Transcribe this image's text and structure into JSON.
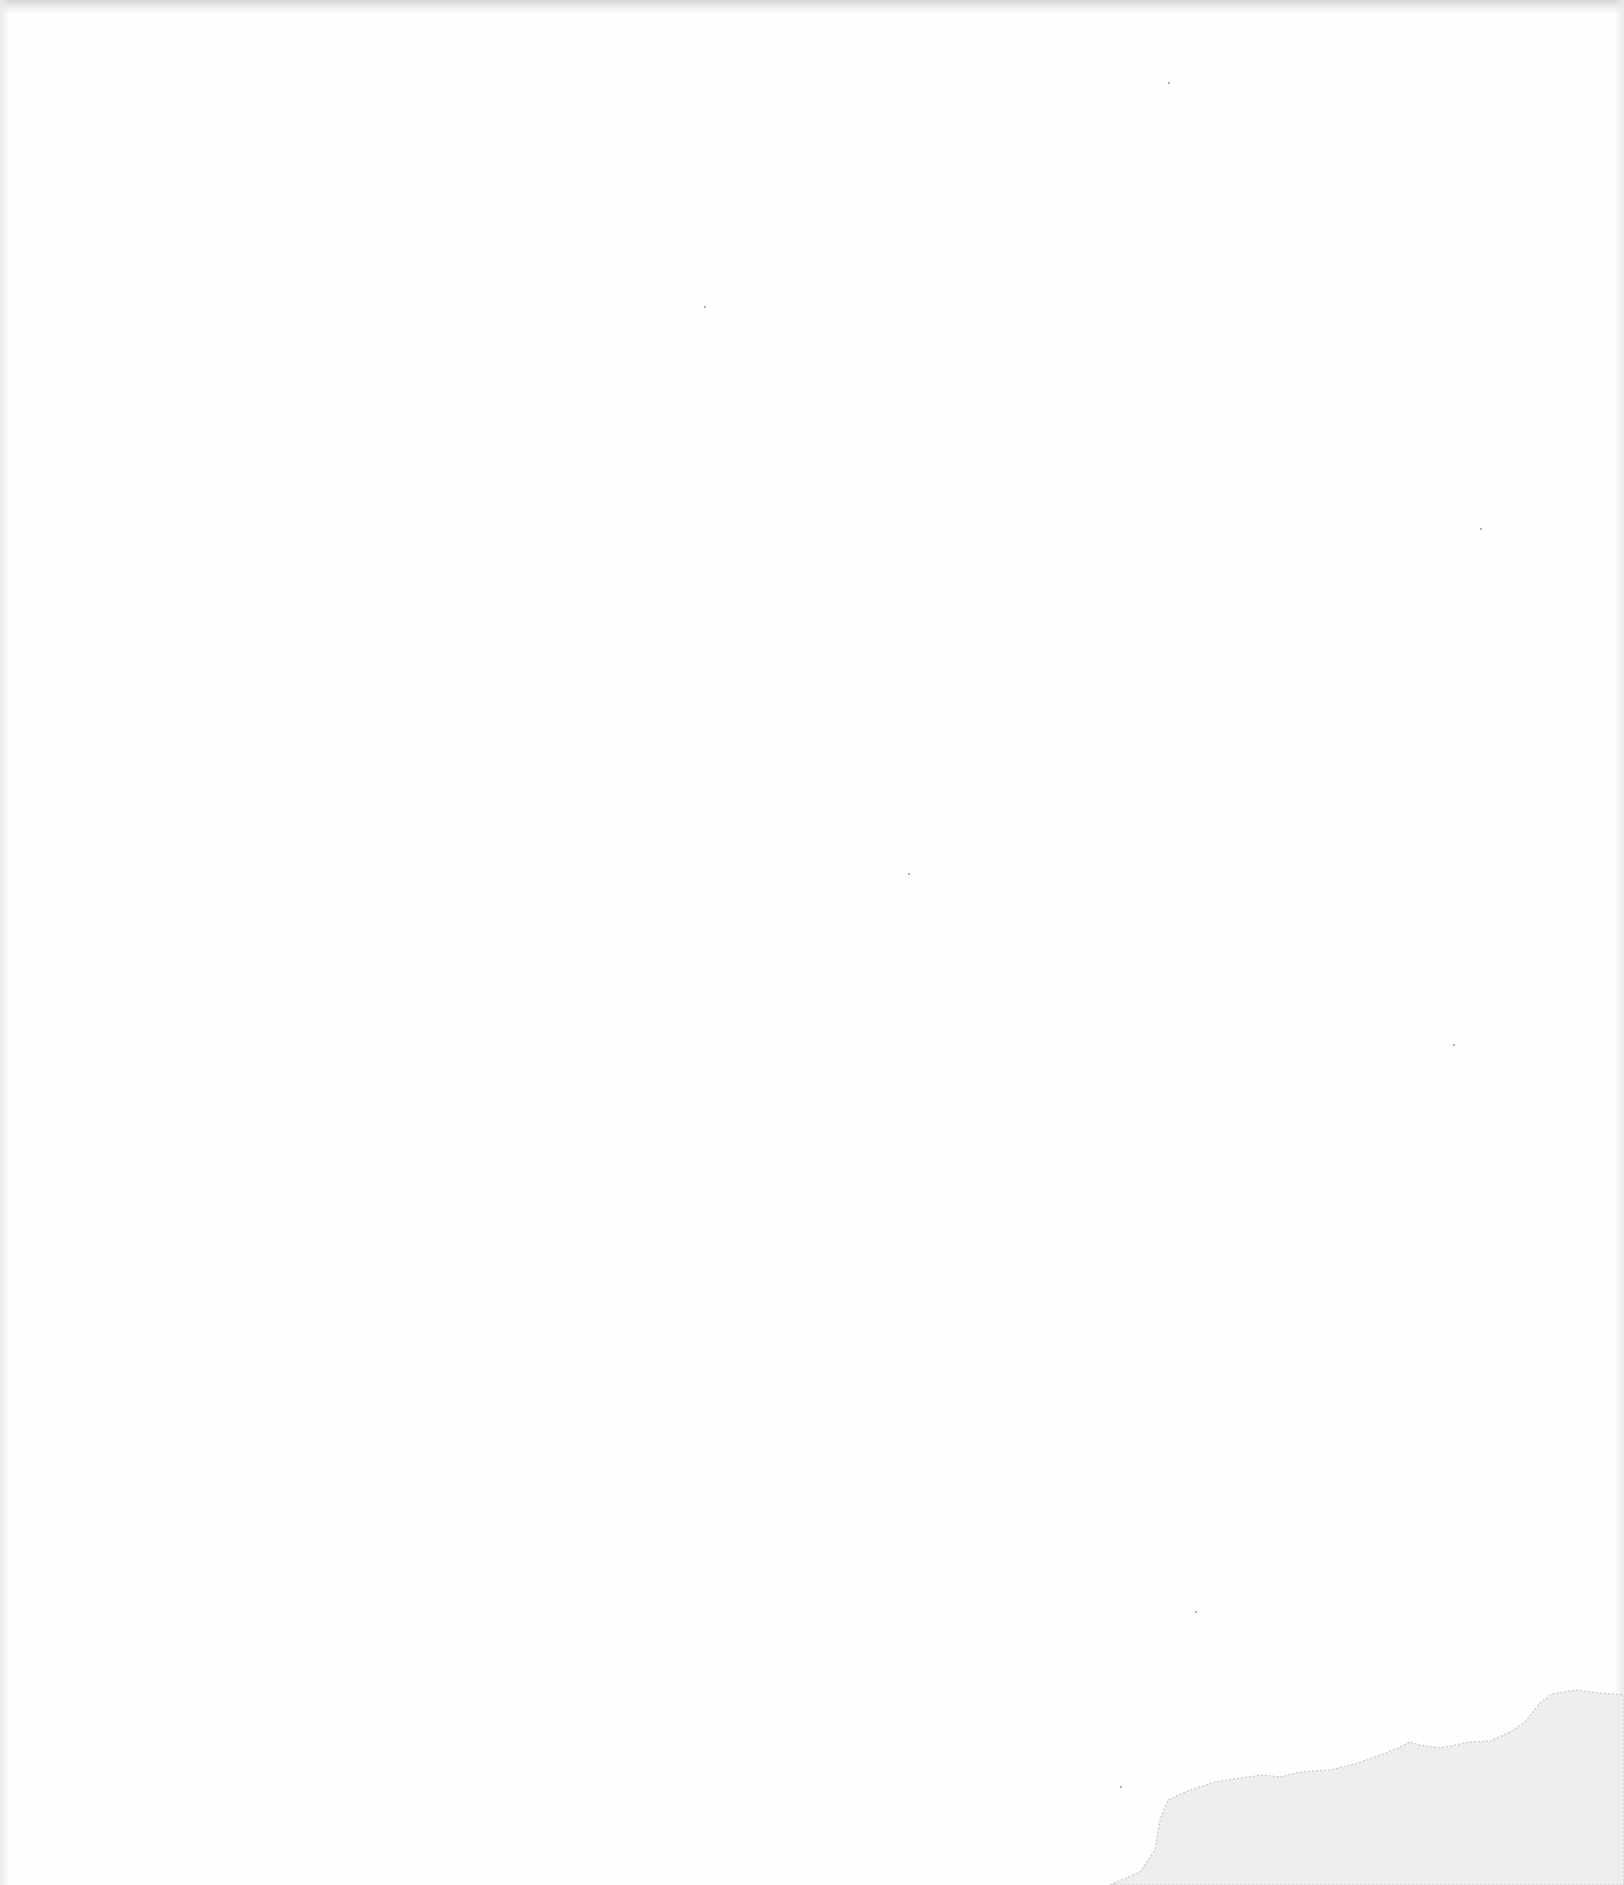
{
  "page": {
    "kind": "blank scanned page",
    "background_color": "#fefefe",
    "edge_shadow_color": "#d6d6d6",
    "stain_fill_color": "#eeeeee",
    "stain_edge_color": "#c8c8c8",
    "speck_color": "#9a9a9a"
  },
  "specks": [
    {
      "x": 1168,
      "y": 82
    },
    {
      "x": 704,
      "y": 306
    },
    {
      "x": 1480,
      "y": 528
    },
    {
      "x": 908,
      "y": 873
    },
    {
      "x": 1453,
      "y": 1044
    },
    {
      "x": 1195,
      "y": 1611
    },
    {
      "x": 1120,
      "y": 1786
    }
  ]
}
